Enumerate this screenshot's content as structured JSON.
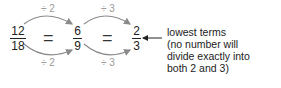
{
  "fractions": [
    {
      "numerator": "12",
      "denominator": "18"
    },
    {
      "numerator": "6",
      "denominator": "9"
    },
    {
      "numerator": "2",
      "denominator": "3"
    }
  ],
  "equals": [
    "=",
    "="
  ],
  "operations": [
    {
      "top": "÷ 2",
      "bottom": "÷ 2"
    },
    {
      "top": "÷ 3",
      "bottom": "÷ 3"
    }
  ],
  "annotation": {
    "lines": [
      "lowest terms",
      "(no number will",
      "divide exactly into",
      "both 2 and 3)"
    ]
  },
  "colors": {
    "arrow": "#8a8a8a",
    "op_text": "#9a9a9a",
    "text": "#222222"
  }
}
